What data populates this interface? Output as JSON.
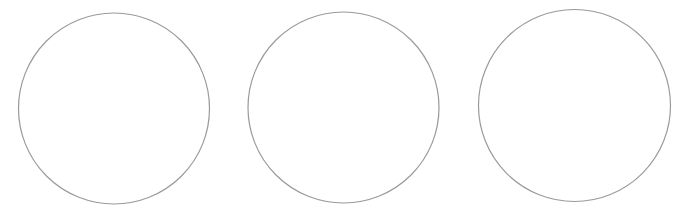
{
  "figure": {
    "width": 684,
    "height": 216,
    "background": "#ffffff",
    "stroke_color": "#9a9a9a",
    "stroke_width": 1.2,
    "fill": "#ffffff",
    "circles": [
      {
        "id": "circle-1",
        "cx": 114,
        "cy": 108.5,
        "r": 95.5
      },
      {
        "id": "circle-2",
        "cx": 343.5,
        "cy": 107.5,
        "r": 95.5
      },
      {
        "id": "circle-3",
        "cx": 574.5,
        "cy": 105.5,
        "r": 96
      }
    ]
  }
}
